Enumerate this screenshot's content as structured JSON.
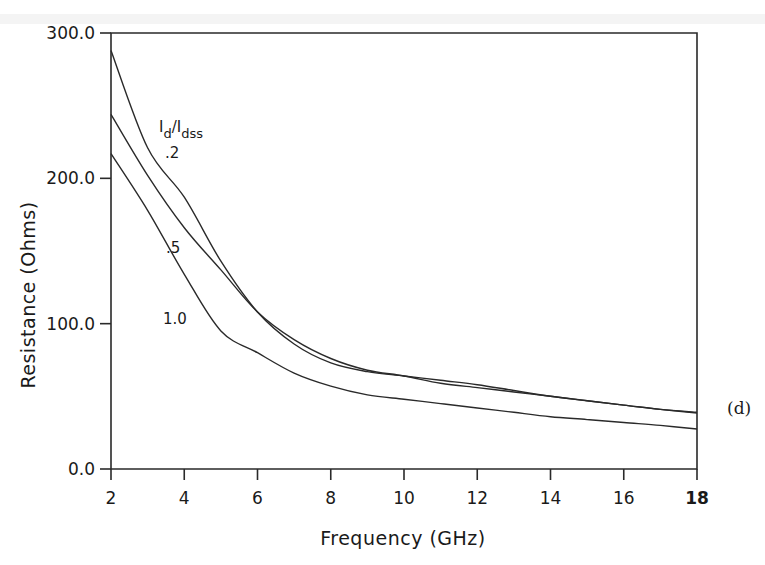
{
  "chart_data": {
    "type": "line",
    "title": "",
    "panel_label": "(d)",
    "xlabel": "Frequency (GHz)",
    "ylabel": "Resistance (Ohms)",
    "xlim": [
      2,
      18
    ],
    "ylim": [
      0,
      300
    ],
    "x_ticks": [
      2,
      4,
      6,
      8,
      10,
      12,
      14,
      16,
      18
    ],
    "x_tick_labels": [
      "2",
      "4",
      "6",
      "8",
      "10",
      "12",
      "14",
      "16",
      "18"
    ],
    "y_ticks": [
      0,
      100,
      200,
      300
    ],
    "y_tick_labels": [
      "0.0",
      "100.0",
      "200.0",
      "300.0"
    ],
    "grid": false,
    "legend": {
      "title": "Id/Idss",
      "title_main": "I",
      "title_sub1": "d",
      "title_slash": "/I",
      "title_sub2": "dss",
      "position": "inline curve labels"
    },
    "x": [
      2,
      3,
      4,
      5,
      6,
      7,
      8,
      9,
      10,
      11,
      12,
      13,
      14,
      15,
      16,
      17,
      18
    ],
    "series": [
      {
        "name": ".2",
        "label": ".2",
        "values": [
          288,
          221,
          187,
          143,
          108,
          86,
          73,
          67,
          64,
          61,
          58,
          54,
          50,
          47,
          44,
          41,
          38.5
        ]
      },
      {
        "name": ".5",
        "label": ".5",
        "values": [
          244,
          202,
          166,
          137,
          108,
          89,
          76,
          68,
          64,
          59,
          56,
          53,
          50,
          47,
          44,
          41,
          39
        ]
      },
      {
        "name": "1.0",
        "label": "1.0",
        "values": [
          217,
          178,
          134,
          95,
          80,
          66,
          57,
          51,
          48,
          45,
          42,
          39,
          36,
          34,
          32,
          30,
          27.5
        ]
      }
    ]
  }
}
